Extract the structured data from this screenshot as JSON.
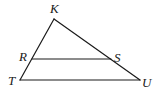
{
  "figure": {
    "type": "triangle-with-parallel-segment",
    "points": {
      "K": {
        "label": "K",
        "x": 54,
        "y": 19,
        "label_x": 50,
        "label_y": 13
      },
      "R": {
        "label": "R",
        "x": 32,
        "y": 59,
        "label_x": 19,
        "label_y": 61
      },
      "S": {
        "label": "S",
        "x": 111,
        "y": 59,
        "label_x": 114,
        "label_y": 62
      },
      "T": {
        "label": "T",
        "x": 20,
        "y": 80,
        "label_x": 8,
        "label_y": 85
      },
      "U": {
        "label": "U",
        "x": 140,
        "y": 80,
        "label_x": 142,
        "label_y": 87
      }
    },
    "segments": [
      [
        "K",
        "T"
      ],
      [
        "K",
        "U"
      ],
      [
        "T",
        "U"
      ],
      [
        "R",
        "S"
      ]
    ],
    "stroke_color": "#1a1a1a",
    "background": "#ffffff"
  }
}
